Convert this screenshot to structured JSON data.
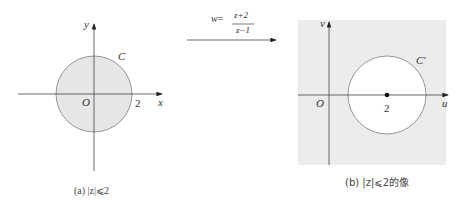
{
  "mapping": {
    "lhs": "w",
    "equals": "=",
    "numerator": "z+2",
    "denominator": "z−1"
  },
  "panel_a": {
    "x_axis_label": "x",
    "y_axis_label": "y",
    "origin_label": "O",
    "tick_label": "2",
    "curve_label": "C",
    "caption": "(a) |z|⩽2",
    "fill_color": "#e6e6e6",
    "region": "disk |z| <= 2"
  },
  "panel_b": {
    "x_axis_label": "u",
    "y_axis_label": "v",
    "origin_label": "O",
    "center_label": "2",
    "curve_label": "C′",
    "caption": "(b) |z|⩽2的像",
    "fill_color": "#ececec",
    "region": "exterior of circle centered at 2"
  }
}
